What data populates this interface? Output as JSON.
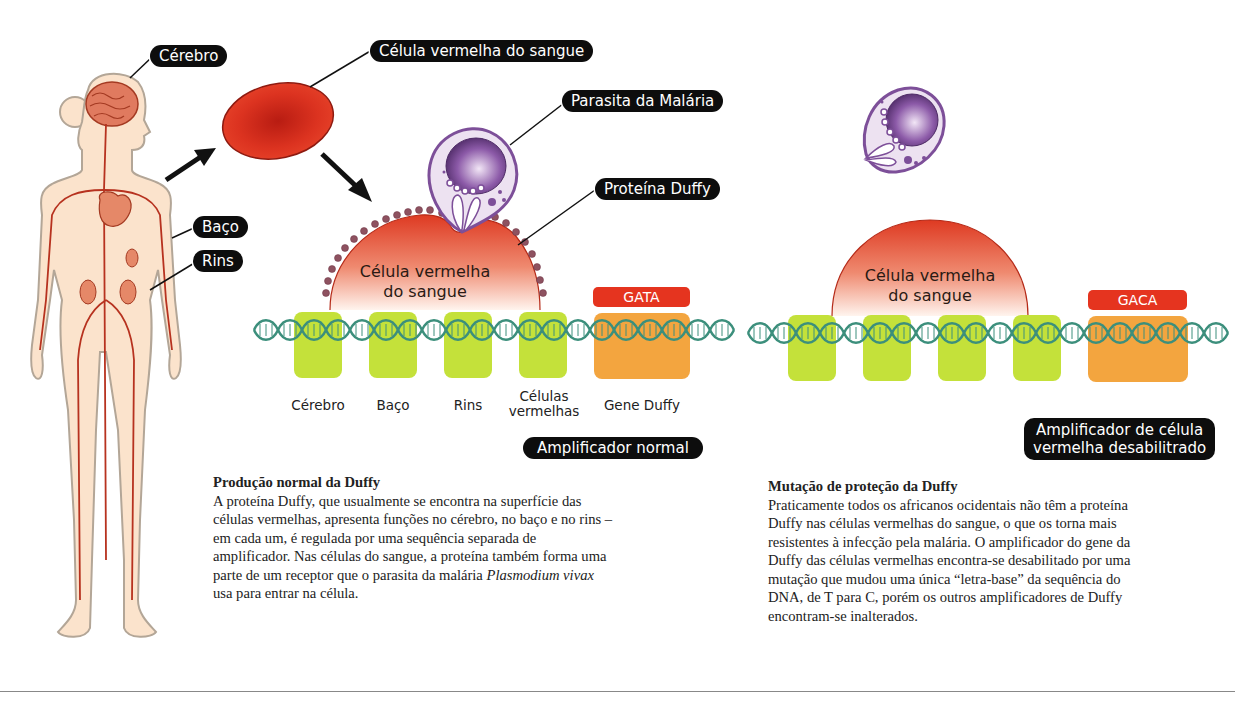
{
  "labels": {
    "brain": "Cérebro",
    "spleen": "Baço",
    "kidneys": "Rins",
    "red_blood_cell": "Célula vermelha do sangue",
    "malaria_parasite": "Parasita da Malária",
    "duffy_protein": "Proteína Duffy"
  },
  "left_panel": {
    "cell_text_line1": "Célula vermelha",
    "cell_text_line2": "do sangue",
    "sequence": "GATA",
    "genes": [
      {
        "label": "Cérebro"
      },
      {
        "label": "Baço"
      },
      {
        "label": "Rins"
      },
      {
        "label": "Células vermelhas"
      },
      {
        "label": "Gene Duffy"
      }
    ],
    "gene_label_rbc_line1": "Células",
    "gene_label_rbc_line2": "vermelhas",
    "badge": "Amplificador normal",
    "caption_title": "Produção normal da Duffy",
    "caption_lines": [
      "A proteína Duffy, que usualmente se encontra na superfície das",
      "células vermelhas, apresenta funções no cérebro, no baço e no rins –",
      "em cada um, é regulada por uma sequência separada de",
      "amplificador. Nas células do sangue, a proteína também forma uma",
      "parte de um receptor que o parasita da malária ",
      "usa para entrar na célula."
    ],
    "caption_italic": "Plasmodium vivax"
  },
  "right_panel": {
    "cell_text_line1": "Célula vermelha",
    "cell_text_line2": "do sangue",
    "sequence": "GACA",
    "badge_line1": "Amplificador de célula",
    "badge_line2": "vermelha desabilitrado",
    "caption_title": "Mutação de proteção da Duffy",
    "caption_lines": [
      "Praticamente todos os africanos ocidentais não têm a proteína",
      "Duffy nas células vermelhas do sangue, o que os torna mais",
      "resistentes à infecção pela malária. O amplificador do gene da",
      "Duffy das células vermelhas encontra-se desabilitado por uma",
      "mutação que mudou uma única “letra-base” da sequência do",
      "DNA, de T para C, porém os outros amplificadores de Duffy",
      "encontram-se inalterados."
    ]
  },
  "colors": {
    "skin": "#fbe3cc",
    "skin_outline": "#b8a898",
    "vessel": "#b7321f",
    "rbc": "#d9301c",
    "parasite": "#8a5aa6",
    "dna": "#3c8f7c",
    "enhancer_green": "#c4e13a",
    "gene_orange": "#f3a53f",
    "sequence_red": "#e5341f",
    "badge_black": "#0d0d0d"
  }
}
